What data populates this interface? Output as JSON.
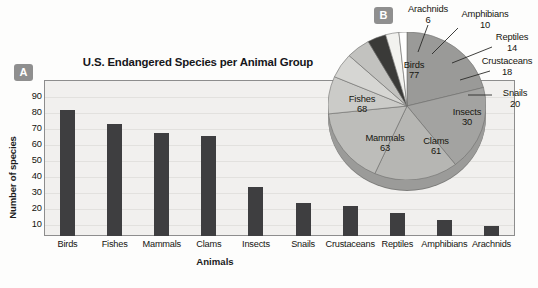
{
  "figure": {
    "panel_a_badge": "A",
    "panel_b_badge": "B"
  },
  "chart_data": [
    {
      "type": "bar",
      "panel": "A",
      "title": "U.S. Endangered Species per Animal Group",
      "xlabel": "Animals",
      "ylabel": "Number of species",
      "categories": [
        "Birds",
        "Fishes",
        "Mammals",
        "Clams",
        "Insects",
        "Snails",
        "Crustaceans",
        "Reptiles",
        "Amphibians",
        "Arachnids"
      ],
      "values": [
        77,
        68,
        63,
        61,
        30,
        20,
        18,
        14,
        10,
        6
      ],
      "yticks": [
        90,
        80,
        70,
        60,
        50,
        40,
        30,
        20,
        10
      ],
      "ylim": [
        0,
        95
      ],
      "grid": true,
      "legend": "none",
      "bar_color": "#3e3e40",
      "plot_background": "#f1f0ee"
    },
    {
      "type": "pie",
      "panel": "B",
      "title": "",
      "labels": [
        "Birds",
        "Fishes",
        "Mammals",
        "Clams",
        "Insects",
        "Snails",
        "Crustaceans",
        "Reptiles",
        "Amphibians",
        "Arachnids"
      ],
      "values": [
        77,
        68,
        63,
        61,
        30,
        20,
        18,
        14,
        10,
        6
      ],
      "total": 367,
      "colors": [
        "#9a9a98",
        "#a3a3a1",
        "#b6b6b3",
        "#bdbdba",
        "#cbcbc8",
        "#d6d6d3",
        "#c2c2bf",
        "#3a3a38",
        "#f2f2ef",
        "#ffffff"
      ],
      "inside_labels": [
        "Birds",
        "Fishes",
        "Mammals",
        "Clams",
        "Insects"
      ],
      "callout_labels": [
        "Snails",
        "Crustaceans",
        "Reptiles",
        "Amphibians",
        "Arachnids"
      ]
    }
  ],
  "bar_chart": {
    "title": "U.S. Endangered Species per Animal Group",
    "ylabel": "Number of species",
    "xlabel": "Animals",
    "yticks": [
      "90",
      "80",
      "70",
      "60",
      "50",
      "40",
      "30",
      "20",
      "10"
    ],
    "bars": [
      {
        "label": "Birds",
        "value": 77
      },
      {
        "label": "Fishes",
        "value": 68
      },
      {
        "label": "Mammals",
        "value": 63
      },
      {
        "label": "Clams",
        "value": 61
      },
      {
        "label": "Insects",
        "value": 30
      },
      {
        "label": "Snails",
        "value": 20
      },
      {
        "label": "Crustaceans",
        "value": 18
      },
      {
        "label": "Reptiles",
        "value": 14
      },
      {
        "label": "Amphibians",
        "value": 10
      },
      {
        "label": "Arachnids",
        "value": 6
      }
    ]
  },
  "pie_chart": {
    "inside": [
      {
        "name": "Birds",
        "value": "77"
      },
      {
        "name": "Fishes",
        "value": "68"
      },
      {
        "name": "Mammals",
        "value": "63"
      },
      {
        "name": "Clams",
        "value": "61"
      },
      {
        "name": "Insects",
        "value": "30"
      }
    ],
    "callouts": [
      {
        "name": "Arachnids",
        "value": "6"
      },
      {
        "name": "Amphibians",
        "value": "10"
      },
      {
        "name": "Reptiles",
        "value": "14"
      },
      {
        "name": "Crustaceans",
        "value": "18"
      },
      {
        "name": "Snails",
        "value": "20"
      }
    ]
  }
}
